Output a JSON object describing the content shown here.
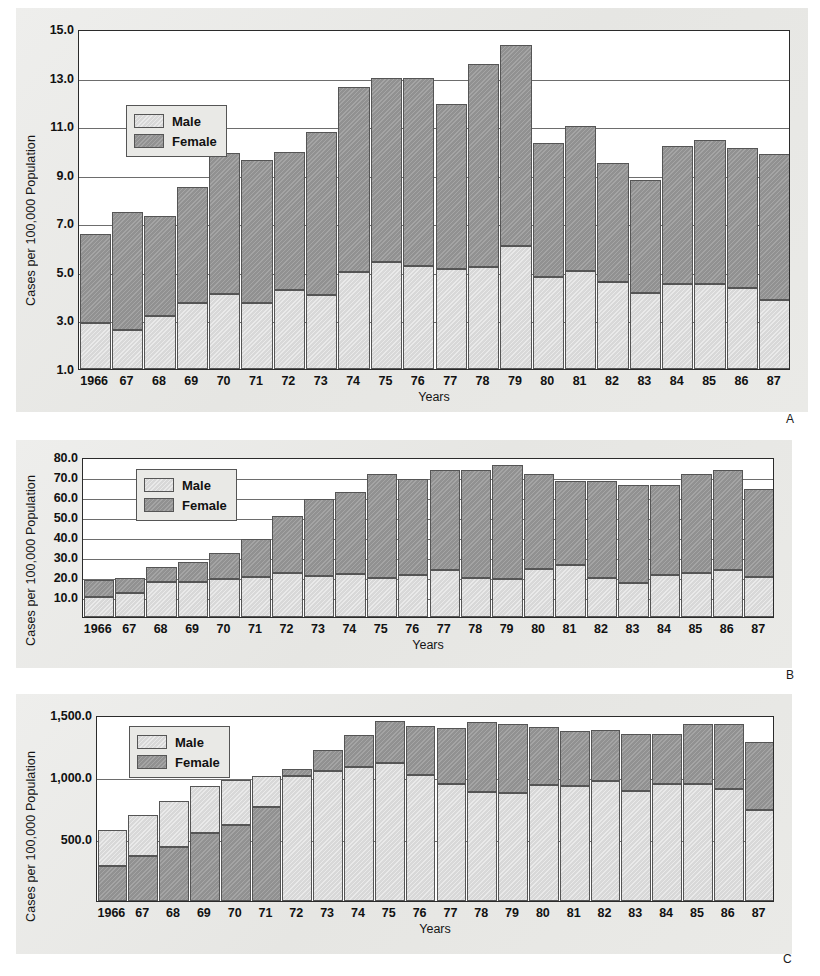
{
  "figure": {
    "panels": [
      {
        "letter": "A",
        "ylabel": "Cases per 100,000 Population",
        "xlabel": "Years",
        "legend": {
          "male": "Male",
          "female": "Female"
        },
        "yticks": [
          "15.0",
          "13.0",
          "11.0",
          "9.0",
          "7.0",
          "5.0",
          "3.0",
          "1.0"
        ],
        "xticks": [
          "1966",
          "67",
          "68",
          "69",
          "70",
          "71",
          "72",
          "73",
          "74",
          "75",
          "76",
          "77",
          "78",
          "79",
          "80",
          "81",
          "82",
          "83",
          "84",
          "85",
          "86",
          "87"
        ]
      },
      {
        "letter": "B",
        "ylabel": "Cases per 100,000 Population",
        "xlabel": "Years",
        "legend": {
          "male": "Male",
          "female": "Female"
        },
        "yticks": [
          "80.0",
          "70.0",
          "60.0",
          "50.0",
          "40.0",
          "30.0",
          "20.0",
          "10.0"
        ],
        "xticks": [
          "1966",
          "67",
          "68",
          "69",
          "70",
          "71",
          "72",
          "73",
          "74",
          "75",
          "76",
          "77",
          "78",
          "79",
          "80",
          "81",
          "82",
          "83",
          "84",
          "85",
          "86",
          "87"
        ]
      },
      {
        "letter": "C",
        "ylabel": "Cases per 100,000 Population",
        "xlabel": "Years",
        "legend": {
          "male": "Male",
          "female": "Female"
        },
        "yticks": [
          "1,500.0",
          "1,000.0",
          "500.0"
        ],
        "xticks": [
          "1966",
          "67",
          "68",
          "69",
          "70",
          "71",
          "72",
          "73",
          "74",
          "75",
          "76",
          "77",
          "78",
          "79",
          "80",
          "81",
          "82",
          "83",
          "84",
          "85",
          "86",
          "87"
        ]
      }
    ]
  },
  "chart_data": [
    {
      "type": "bar",
      "stacked": true,
      "panel": "A",
      "title": "",
      "xlabel": "Years",
      "ylabel": "Cases per 100,000 Population",
      "ylim": [
        1.0,
        15.0
      ],
      "ytick_values": [
        1.0,
        3.0,
        5.0,
        7.0,
        9.0,
        11.0,
        13.0,
        15.0
      ],
      "grid": true,
      "legend_position": "upper-left-inside",
      "stack_order": [
        "Male",
        "Female"
      ],
      "categories": [
        "1966",
        "67",
        "68",
        "69",
        "70",
        "71",
        "72",
        "73",
        "74",
        "75",
        "76",
        "77",
        "78",
        "79",
        "80",
        "81",
        "82",
        "83",
        "84",
        "85",
        "86",
        "87"
      ],
      "series": [
        {
          "name": "Male",
          "values": [
            1.9,
            1.6,
            2.2,
            2.7,
            3.1,
            2.7,
            3.25,
            3.05,
            4.0,
            4.4,
            4.25,
            4.1,
            4.2,
            5.05,
            3.8,
            4.05,
            3.6,
            3.15,
            3.5,
            3.5,
            3.35,
            2.85
          ]
        },
        {
          "name": "Female",
          "values": [
            3.65,
            4.85,
            4.1,
            4.8,
            5.8,
            5.9,
            5.7,
            6.7,
            7.6,
            7.6,
            7.75,
            6.8,
            8.35,
            8.3,
            5.5,
            5.95,
            4.9,
            4.65,
            5.7,
            5.95,
            5.75,
            6.0
          ]
        }
      ],
      "totals": [
        5.55,
        6.45,
        6.3,
        7.5,
        8.9,
        8.6,
        8.95,
        9.75,
        11.6,
        12.0,
        12.0,
        10.9,
        12.55,
        13.35,
        9.3,
        10.0,
        8.5,
        7.8,
        9.2,
        9.45,
        9.1,
        8.85
      ]
    },
    {
      "type": "bar",
      "stacked": true,
      "panel": "B",
      "title": "",
      "xlabel": "Years",
      "ylabel": "Cases per 100,000 Population",
      "ylim": [
        0.0,
        80.0
      ],
      "ytick_values": [
        10.0,
        20.0,
        30.0,
        40.0,
        50.0,
        60.0,
        70.0,
        80.0
      ],
      "grid": true,
      "legend_position": "upper-left-inside",
      "stack_order": [
        "Male",
        "Female"
      ],
      "categories": [
        "1966",
        "67",
        "68",
        "69",
        "70",
        "71",
        "72",
        "73",
        "74",
        "75",
        "76",
        "77",
        "78",
        "79",
        "80",
        "81",
        "82",
        "83",
        "84",
        "85",
        "86",
        "87"
      ],
      "series": [
        {
          "name": "Male",
          "values": [
            10.0,
            12.0,
            17.5,
            17.5,
            19.0,
            20.0,
            21.8,
            20.5,
            21.5,
            19.5,
            20.8,
            23.3,
            19.5,
            19.0,
            24.0,
            26.0,
            19.5,
            17.0,
            21.0,
            22.0,
            23.3,
            19.8
          ]
        },
        {
          "name": "Female",
          "values": [
            8.5,
            7.5,
            7.3,
            10.0,
            13.0,
            19.0,
            28.8,
            38.7,
            41.0,
            52.2,
            48.2,
            50.0,
            53.8,
            57.2,
            47.5,
            42.0,
            48.5,
            49.0,
            44.8,
            49.5,
            50.2,
            44.0
          ]
        }
      ],
      "totals": [
        18.5,
        19.5,
        24.8,
        27.5,
        32.0,
        39.0,
        50.6,
        59.2,
        62.5,
        71.7,
        69.0,
        73.3,
        73.3,
        76.2,
        71.5,
        68.0,
        68.0,
        66.0,
        65.8,
        71.5,
        73.5,
        63.8
      ]
    },
    {
      "type": "bar",
      "stacked": true,
      "panel": "C",
      "title": "",
      "xlabel": "Years",
      "ylabel": "Cases per 100,000 Population",
      "ylim": [
        0.0,
        1500.0
      ],
      "ytick_values": [
        500.0,
        1000.0,
        1500.0
      ],
      "grid": true,
      "legend_position": "upper-left-inside",
      "stack_order": [
        "Female",
        "Male"
      ],
      "note": "Female segment is drawn at the bottom of the stack for 1966-1971; Male is at the bottom from 1972 onward.",
      "categories": [
        "1966",
        "67",
        "68",
        "69",
        "70",
        "71",
        "72",
        "73",
        "74",
        "75",
        "76",
        "77",
        "78",
        "79",
        "80",
        "81",
        "82",
        "83",
        "84",
        "85",
        "86",
        "87"
      ],
      "series": [
        {
          "name": "Male",
          "values": [
            290,
            330,
            375,
            385,
            365,
            250,
            1005,
            1045,
            1080,
            1115,
            1020,
            945,
            880,
            870,
            935,
            930,
            965,
            885,
            940,
            945,
            905,
            735
          ]
        },
        {
          "name": "Female",
          "values": [
            285,
            365,
            435,
            545,
            610,
            755,
            60,
            175,
            255,
            335,
            390,
            450,
            560,
            555,
            465,
            445,
            415,
            465,
            410,
            485,
            525,
            545
          ]
        }
      ],
      "totals": [
        575,
        695,
        810,
        930,
        975,
        1005,
        1065,
        1220,
        1335,
        1450,
        1410,
        1395,
        1440,
        1425,
        1400,
        1375,
        1380,
        1350,
        1350,
        1430,
        1430,
        1280
      ]
    }
  ]
}
